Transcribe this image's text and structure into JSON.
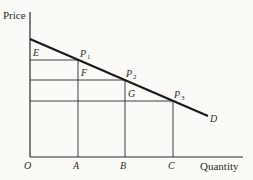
{
  "diagram": {
    "y_axis_label": "Price",
    "x_axis_label": "Quantity",
    "origin_label": "O",
    "x_ticks": [
      "A",
      "B",
      "C"
    ],
    "curve_label": "D",
    "points": [
      {
        "name": "P",
        "sub": "1"
      },
      {
        "name": "P",
        "sub": "2"
      },
      {
        "name": "P",
        "sub": "3"
      }
    ],
    "region_labels": [
      "E",
      "F",
      "G"
    ]
  }
}
